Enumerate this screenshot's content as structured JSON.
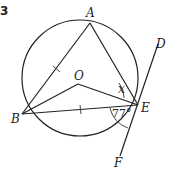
{
  "question_number": "3",
  "diagram": {
    "circle": {
      "center": "O",
      "cx": 80,
      "cy": 78,
      "r": 58
    },
    "points": {
      "A": {
        "label": "A",
        "x": 90,
        "y": 23,
        "lx": 86,
        "ly": 15
      },
      "B": {
        "label": "B",
        "x": 22,
        "y": 114,
        "lx": 10,
        "ly": 122
      },
      "E": {
        "label": "E",
        "x": 138,
        "y": 105,
        "lx": 141,
        "ly": 111
      },
      "O": {
        "label": "O",
        "x": 78,
        "y": 84,
        "lx": 74,
        "ly": 79
      },
      "D": {
        "label": "D",
        "x": 158,
        "y": 49,
        "lx": 157,
        "ly": 47
      },
      "F": {
        "label": "F",
        "x": 122,
        "y": 150,
        "lx": 113,
        "ly": 166
      }
    },
    "segments": [
      "AB",
      "AE",
      "BE",
      "BO",
      "OE",
      "DF"
    ],
    "equal_ticks": [
      "AB",
      "BE"
    ],
    "angles": {
      "x": {
        "label": "x",
        "vertex": "E",
        "between": [
          "EA",
          "EO"
        ]
      },
      "given": {
        "label": "77°",
        "vertex": "E",
        "between": [
          "EB",
          "EF"
        ],
        "value": 77
      }
    },
    "tangent": {
      "line": "DF",
      "touches_at": "E"
    }
  }
}
